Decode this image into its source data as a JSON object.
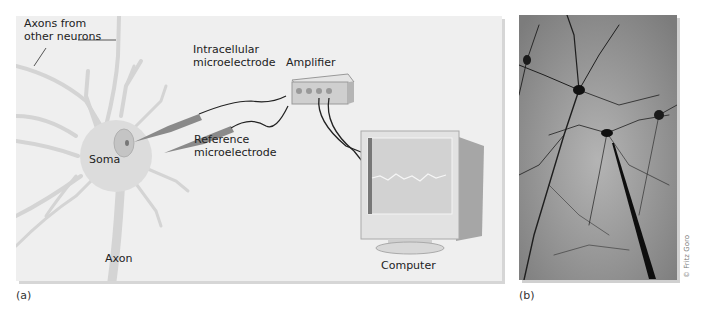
{
  "figure": {
    "panel_a": {
      "caption": "(a)",
      "labels": {
        "axons_from_other_neurons_line1": "Axons from",
        "axons_from_other_neurons_line2": "other neurons",
        "intracellular_line1": "Intracellular",
        "intracellular_line2": "microelectrode",
        "amplifier": "Amplifier",
        "reference_line1": "Reference",
        "reference_line2": "microelectrode",
        "soma": "Soma",
        "axon": "Axon",
        "computer": "Computer"
      }
    },
    "panel_b": {
      "caption": "(b)",
      "credit": "© Fritz Goro"
    },
    "colors": {
      "panel_background": "#efefef",
      "neuron_fill": "#dcdcdc",
      "electrode": "#8a8a8a",
      "wire": "#222222",
      "photo_background": "#9a9a9a"
    }
  }
}
